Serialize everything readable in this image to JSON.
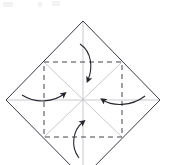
{
  "figure": {
    "title": "Origami fold step: fold four corners to center",
    "canvas": {
      "width": 170,
      "height": 165,
      "background": "#ffffff"
    },
    "colors": {
      "outline": "#3a3a44",
      "crease_dashed": "#44444c",
      "crease_light": "#c9c9cf",
      "arrow": "#24242c",
      "background": "#ffffff",
      "artifact": "#f2f2f4"
    },
    "shapes": {
      "outer_diamond": {
        "name": "square-rotated-45",
        "stroke": "#3a3a44",
        "stroke_width": 1,
        "style": "solid",
        "points": [
          {
            "label": "top",
            "x": 83,
            "y": 21
          },
          {
            "label": "right",
            "x": 160,
            "y": 100
          },
          {
            "label": "bottom",
            "x": 83,
            "y": 178
          },
          {
            "label": "left",
            "x": 6,
            "y": 100
          }
        ],
        "note": "bottom vertex extends past the bottom edge of the frame"
      },
      "inner_dashed_square": {
        "name": "inner-crease-square",
        "stroke": "#44444c",
        "stroke_width": 1,
        "style": "dashed",
        "dash_pattern": "5 4",
        "left": 44,
        "top": 62,
        "right": 122,
        "bottom": 137
      },
      "center_point": {
        "x": 83,
        "y": 100
      },
      "light_creases": {
        "stroke": "#c9c9cf",
        "stroke_width": 1,
        "style": "solid",
        "segments": [
          {
            "name": "diagonal-nw-se",
            "x1": 44,
            "y1": 62,
            "x2": 122,
            "y2": 137
          },
          {
            "name": "diagonal-ne-sw",
            "x1": 122,
            "y1": 62,
            "x2": 44,
            "y2": 137
          },
          {
            "name": "horizontal-midline",
            "x1": 6,
            "y1": 100,
            "x2": 160,
            "y2": 100
          },
          {
            "name": "vertical-midline",
            "x1": 83,
            "y1": 21,
            "x2": 83,
            "y2": 178
          }
        ]
      }
    },
    "arrows": [
      {
        "name": "fold-arrow-top",
        "direction": "down",
        "description": "top corner folds down to center",
        "path": "M 80 44 C 92 52, 93 68, 88 80",
        "head": {
          "x": 88,
          "y": 83,
          "angle": 110
        }
      },
      {
        "name": "fold-arrow-left",
        "direction": "right",
        "description": "left corner folds right to center",
        "path": "M 22 95 C 36 104, 54 102, 64 94",
        "head": {
          "x": 67,
          "y": 92,
          "angle": -32
        }
      },
      {
        "name": "fold-arrow-right",
        "direction": "left",
        "description": "right corner folds left to center",
        "path": "M 145 96 C 131 107, 112 106, 103 100",
        "head": {
          "x": 100,
          "y": 98,
          "angle": 208
        }
      },
      {
        "name": "fold-arrow-bottom",
        "direction": "up",
        "description": "bottom corner folds up to center",
        "path": "M 79 158 C 70 146, 73 130, 83 122",
        "head": {
          "x": 86,
          "y": 119,
          "angle": -50
        }
      }
    ],
    "artifacts": [
      {
        "name": "top-artifact-1",
        "x": 3,
        "y": 2,
        "w": 10,
        "h": 5
      },
      {
        "name": "top-artifact-2",
        "x": 38,
        "y": 2,
        "w": 4,
        "h": 5
      },
      {
        "name": "top-artifact-3",
        "x": 52,
        "y": 1,
        "w": 8,
        "h": 5
      }
    ]
  }
}
